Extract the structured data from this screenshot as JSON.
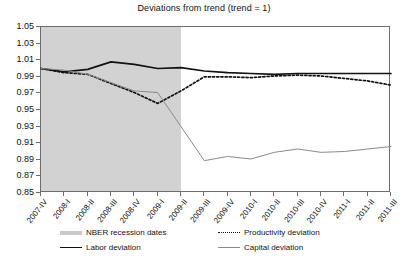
{
  "chart_data": {
    "type": "line",
    "title": "Deviations from trend (trend = 1)",
    "xlabel": "",
    "ylabel": "",
    "ylim": [
      0.85,
      1.05
    ],
    "yticks": [
      0.85,
      0.87,
      0.89,
      0.91,
      0.93,
      0.95,
      0.97,
      0.99,
      1.01,
      1.03,
      1.05
    ],
    "ytick_labels": [
      "0.85",
      "0.87",
      "0.89",
      "0.91",
      "0.93",
      "0.95",
      "0.97",
      "0.99",
      "1.01",
      "1.03",
      "1.05"
    ],
    "grid": false,
    "legend_position": "bottom",
    "categories": [
      "2007-IV",
      "2008-I",
      "2008-II",
      "2008-III",
      "2008-IV",
      "2009-I",
      "2009-II",
      "2009-III",
      "2009-IV",
      "2010-I",
      "2010-II",
      "2010-III",
      "2010-IV",
      "2011-I",
      "2011-II",
      "2011-III"
    ],
    "series": [
      {
        "name": "Labor deviation",
        "style": "solid",
        "color": "#111111",
        "values": [
          1.0,
          0.996,
          0.999,
          1.008,
          1.005,
          1.0,
          1.001,
          0.997,
          0.995,
          0.994,
          0.993,
          0.994,
          0.994,
          0.994,
          0.994,
          0.994
        ]
      },
      {
        "name": "Productivity deviation",
        "style": "dotted",
        "color": "#111111",
        "values": [
          1.0,
          0.995,
          0.993,
          0.982,
          0.971,
          0.958,
          0.973,
          0.99,
          0.99,
          0.989,
          0.991,
          0.992,
          0.991,
          0.988,
          0.985,
          0.98
        ]
      },
      {
        "name": "Capital deviation",
        "style": "solid-thin",
        "color": "#8a8a8a",
        "values": [
          1.0,
          0.998,
          0.993,
          0.983,
          0.973,
          0.971,
          0.93,
          0.889,
          0.894,
          0.891,
          0.899,
          0.903,
          0.899,
          0.9,
          0.903,
          0.906
        ]
      }
    ],
    "recession_band": {
      "label": "NBER recession dates",
      "color": "#d2d2d2",
      "start_category": "2007-IV",
      "end_category": "2009-II"
    }
  },
  "legend": {
    "items": [
      {
        "label": "NBER recession dates",
        "key": "band-swatch"
      },
      {
        "label": "Productivity deviation",
        "key": "dotted-line"
      },
      {
        "label": "Labor deviation",
        "key": "solid-black-line"
      },
      {
        "label": "Capital deviation",
        "key": "solid-gray-line"
      }
    ]
  }
}
